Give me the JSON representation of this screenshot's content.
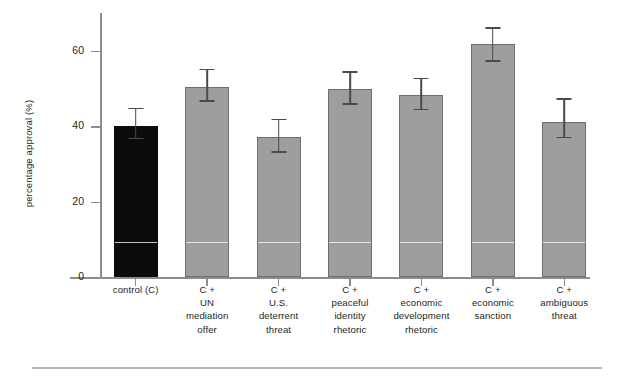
{
  "chart_data": {
    "type": "bar",
    "title": "",
    "xlabel": "",
    "ylabel": "percentage approval (%)",
    "ylim": [
      0,
      70
    ],
    "yticks": [
      0,
      20,
      40,
      60
    ],
    "ytick_labels": [
      "0",
      "20",
      "40",
      "60"
    ],
    "grid": false,
    "legend": "none",
    "categories": [
      "control (C)",
      "C + UN mediation offer",
      "C + U.S. deterrent threat",
      "C + peaceful identity rhetoric",
      "C + economic development rhetoric",
      "C + economic sanction",
      "C + ambiguous threat"
    ],
    "category_lines": [
      [
        "control (C)"
      ],
      [
        "C +",
        "UN",
        "mediation",
        "offer"
      ],
      [
        "C +",
        "U.S.",
        "deterrent",
        "threat"
      ],
      [
        "C +",
        "peaceful",
        "identity",
        "rhetoric"
      ],
      [
        "C +",
        "economic",
        "development",
        "rhetoric"
      ],
      [
        "C +",
        "economic",
        "sanction"
      ],
      [
        "C +",
        "ambiguous",
        "threat"
      ]
    ],
    "values": [
      40.0,
      50.5,
      37.2,
      49.8,
      48.3,
      61.8,
      41.2
    ],
    "error_low": [
      36.5,
      46.5,
      32.9,
      45.6,
      44.2,
      57.0,
      36.8
    ],
    "error_high": [
      44.5,
      54.8,
      41.6,
      54.2,
      52.4,
      65.8,
      47.0
    ],
    "bar_colors": [
      "#0c0c0c",
      "#9e9e9e",
      "#9e9e9e",
      "#9e9e9e",
      "#9e9e9e",
      "#9e9e9e",
      "#9e9e9e"
    ],
    "bar_edge_color": "#6e6e6e",
    "error_bar_color": "#4a4a4a",
    "axis_color": "#8c8c8c",
    "control_color": "#0c0c0c",
    "treatment_color": "#9e9e9e",
    "internal_rule_value": 8.8
  }
}
